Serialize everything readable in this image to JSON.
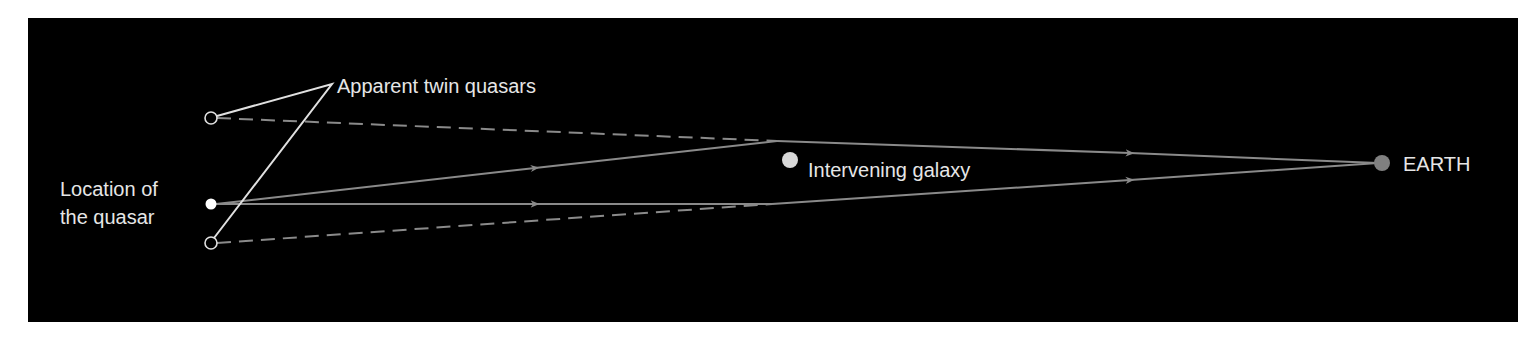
{
  "diagram": {
    "labels": {
      "apparent": "Apparent twin quasars",
      "quasar_line1": "Location of",
      "quasar_line2": "the quasar",
      "galaxy": "Intervening galaxy",
      "earth": "EARTH"
    },
    "colors": {
      "background": "#000000",
      "ray": "#8a8a8a",
      "leader": "#e0e0e0",
      "text": "#e6e6e6",
      "earth": "#808080",
      "galaxy": "#d8d8d8",
      "quasar": "#ffffff"
    },
    "nodes": {
      "quasar": {
        "x": 211,
        "y": 204
      },
      "image_upper": {
        "x": 211,
        "y": 118
      },
      "image_lower": {
        "x": 211,
        "y": 243
      },
      "galaxy": {
        "x": 790,
        "y": 160
      },
      "earth": {
        "x": 1382,
        "y": 163
      },
      "upper_bend": {
        "x": 777,
        "y": 141
      },
      "lower_bend": {
        "x": 772,
        "y": 204
      }
    }
  }
}
